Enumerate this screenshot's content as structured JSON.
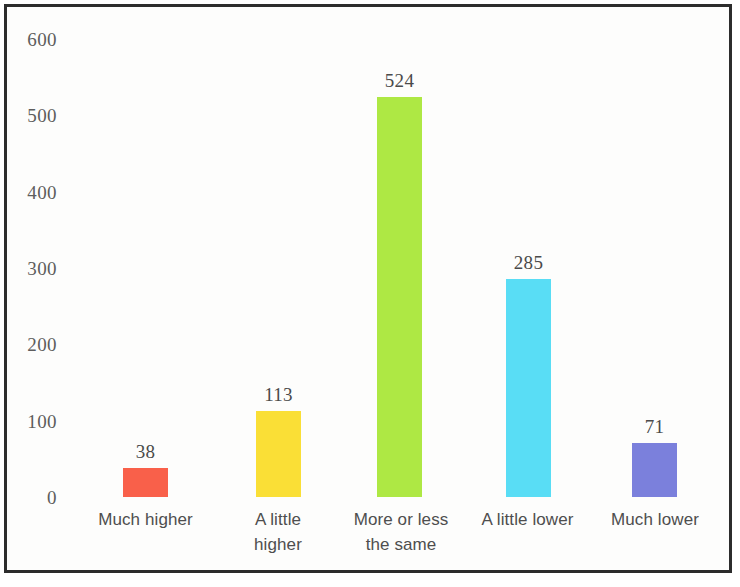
{
  "chart_data": {
    "type": "bar",
    "title": "",
    "subtitle": "",
    "xlabel": "",
    "ylabel": "",
    "categories": [
      "Much higher",
      "A little\nhigher",
      "More or less\nthe same",
      "A little lower",
      "Much lower"
    ],
    "values": [
      38,
      113,
      524,
      285,
      71
    ],
    "value_labels": [
      "38",
      "113",
      "524",
      "285",
      "71"
    ],
    "colors": [
      "#f9604a",
      "#fadf36",
      "#aee844",
      "#59ddf5",
      "#7b80dc"
    ],
    "ylim": [
      0,
      600
    ],
    "yticks": [
      0,
      100,
      200,
      300,
      400,
      500,
      600
    ],
    "ytick_labels": [
      "0",
      "100",
      "200",
      "300",
      "400",
      "500",
      "600"
    ],
    "grid": false,
    "legend": null,
    "legend_position": "none",
    "axis_line": false,
    "frame_color": "#2c2c2c",
    "background": "#fdfdfc",
    "tick_text_color": "#5d5d5d",
    "label_text_color": "#4e4e4e",
    "value_text_color": "#4a4a4a"
  }
}
